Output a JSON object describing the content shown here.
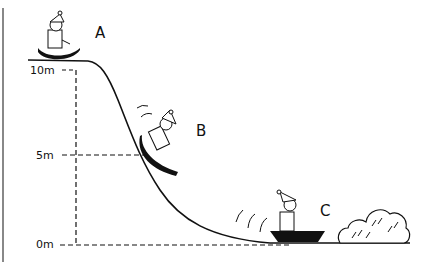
{
  "diagram": {
    "type": "physics-illustration",
    "heights": [
      {
        "label": "10m",
        "value_m": 10
      },
      {
        "label": "5m",
        "value_m": 5
      },
      {
        "label": "0m",
        "value_m": 0
      }
    ],
    "positions": [
      {
        "label": "A",
        "height_m": 10
      },
      {
        "label": "B",
        "height_m": 5
      },
      {
        "label": "C",
        "height_m": 0
      }
    ],
    "colors": {
      "ink": "#111111",
      "background": "#ffffff",
      "frame": "#888888"
    }
  }
}
